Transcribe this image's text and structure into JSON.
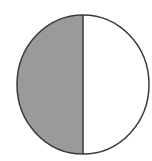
{
  "diagram": {
    "type": "fraction-circle",
    "parts_total": 2,
    "parts_shaded": 1,
    "shaded_side": "left",
    "colors": {
      "shaded_fill": "#9a9a9a",
      "unshaded_fill": "#ffffff",
      "outline": "#3a3a3a"
    }
  }
}
